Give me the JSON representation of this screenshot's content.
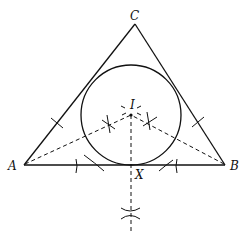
{
  "diagram": {
    "points": {
      "A": {
        "label": "A"
      },
      "B": {
        "label": "B"
      },
      "C": {
        "label": "C"
      },
      "I": {
        "label": "I"
      },
      "X": {
        "label": "X"
      }
    },
    "elements": [
      "triangle ABC (solid)",
      "incircle centered at I tangent to AB at X (solid)",
      "angle bisector from A to I (dashed)",
      "angle bisector from B to I (dashed)",
      "perpendicular from I through X (dashed)",
      "construction arcs and cross marks"
    ],
    "colors": {
      "ink": "#111111",
      "background": "#ffffff"
    }
  }
}
